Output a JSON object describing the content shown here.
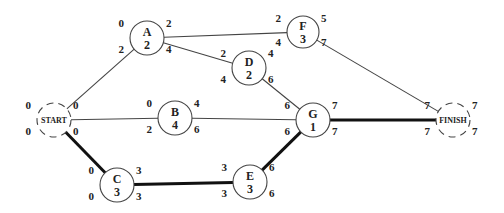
{
  "diagram": {
    "type": "activity-on-node network (critical path)",
    "critical_path": [
      "START",
      "C",
      "E",
      "G",
      "FINISH"
    ],
    "nodes": [
      {
        "id": "START",
        "label": "START",
        "duration": null,
        "terminal": true,
        "cx": 54,
        "cy": 120,
        "r": 17,
        "tl": "0",
        "tr": "0",
        "bl": "0",
        "br": "0"
      },
      {
        "id": "A",
        "label": "A",
        "duration": "2",
        "terminal": false,
        "cx": 147,
        "cy": 38,
        "r": 17,
        "tl": "0",
        "tr": "2",
        "bl": "2",
        "br": "4"
      },
      {
        "id": "B",
        "label": "B",
        "duration": "4",
        "terminal": false,
        "cx": 175,
        "cy": 118,
        "r": 17,
        "tl": "0",
        "tr": "4",
        "bl": "2",
        "br": "6"
      },
      {
        "id": "C",
        "label": "C",
        "duration": "3",
        "terminal": false,
        "cx": 117,
        "cy": 185,
        "r": 17,
        "tl": "0",
        "tr": "3",
        "bl": "0",
        "br": "3"
      },
      {
        "id": "D",
        "label": "D",
        "duration": "2",
        "terminal": false,
        "cx": 249,
        "cy": 68,
        "r": 17,
        "tl": "2",
        "tr": "4",
        "bl": "4",
        "br": "6"
      },
      {
        "id": "E",
        "label": "E",
        "duration": "3",
        "terminal": false,
        "cx": 250,
        "cy": 182,
        "r": 17,
        "tl": "3",
        "tr": "6",
        "bl": "3",
        "br": "6"
      },
      {
        "id": "F",
        "label": "F",
        "duration": "3",
        "terminal": false,
        "cx": 303,
        "cy": 32,
        "r": 16,
        "tl": "2",
        "tr": "5",
        "bl": "4",
        "br": "7"
      },
      {
        "id": "G",
        "label": "G",
        "duration": "1",
        "terminal": false,
        "cx": 313,
        "cy": 120,
        "r": 17,
        "tl": "6",
        "tr": "7",
        "bl": "6",
        "br": "7"
      },
      {
        "id": "FINISH",
        "label": "FINISH",
        "duration": null,
        "terminal": true,
        "cx": 453,
        "cy": 120,
        "r": 17,
        "tl": "7",
        "tr": "7",
        "bl": "7",
        "br": "7"
      }
    ],
    "edges": [
      {
        "from": "START",
        "to": "A",
        "critical": false
      },
      {
        "from": "START",
        "to": "B",
        "critical": false
      },
      {
        "from": "START",
        "to": "C",
        "critical": true
      },
      {
        "from": "A",
        "to": "F",
        "critical": false
      },
      {
        "from": "A",
        "to": "D",
        "critical": false
      },
      {
        "from": "D",
        "to": "G",
        "critical": false
      },
      {
        "from": "B",
        "to": "G",
        "critical": false
      },
      {
        "from": "C",
        "to": "E",
        "critical": true
      },
      {
        "from": "E",
        "to": "G",
        "critical": true
      },
      {
        "from": "F",
        "to": "FINISH",
        "critical": false
      },
      {
        "from": "G",
        "to": "FINISH",
        "critical": true
      }
    ],
    "legend_positions": {
      "tl": "early start",
      "tr": "early finish",
      "bl": "late start",
      "br": "late finish"
    }
  }
}
